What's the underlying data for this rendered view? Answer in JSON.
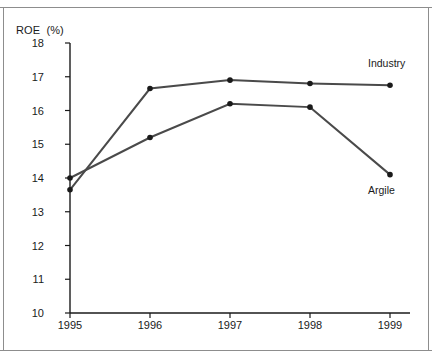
{
  "chart_data": {
    "type": "line",
    "title": "ROE  (%)",
    "ylabel": "ROE (%)",
    "xlabel": "",
    "categories": [
      "1995",
      "1996",
      "1997",
      "1998",
      "1999"
    ],
    "x": [
      1995,
      1996,
      1997,
      1998,
      1999
    ],
    "ylim": [
      10,
      18
    ],
    "ytick_labels": [
      "10",
      "11",
      "12",
      "13",
      "14",
      "15",
      "16",
      "17",
      "18"
    ],
    "yticks": [
      10,
      11,
      12,
      13,
      14,
      15,
      16,
      17,
      18
    ],
    "grid": false,
    "legend_position": "inline-right",
    "series": [
      {
        "name": "Industry",
        "values": [
          13.65,
          16.65,
          16.9,
          16.8,
          16.75
        ],
        "color": "#4a4a4a",
        "label_x": 1999,
        "label_y": 17.4
      },
      {
        "name": "Argile",
        "values": [
          14.0,
          15.2,
          16.2,
          16.1,
          14.1
        ],
        "color": "#4a4a4a",
        "label_x": 1999,
        "label_y": 13.65
      }
    ],
    "marker": "circle",
    "marker_color": "#1a1a1a",
    "axis_color": "#1a1a1a",
    "frame_color": "#8d8d8d",
    "background": "#ffffff"
  }
}
